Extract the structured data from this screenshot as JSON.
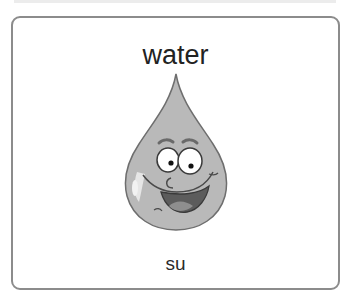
{
  "card": {
    "word": "water",
    "translation": "su",
    "image": {
      "icon": "water-drop-cartoon-icon",
      "description": "smiling cartoon water droplet"
    }
  },
  "colors": {
    "border": "#8c8c8c",
    "drop_fill": "#b8b8b8",
    "drop_outline": "#6e6e6e",
    "mouth": "#5a5a5a",
    "tongue": "#8a8a8a"
  }
}
